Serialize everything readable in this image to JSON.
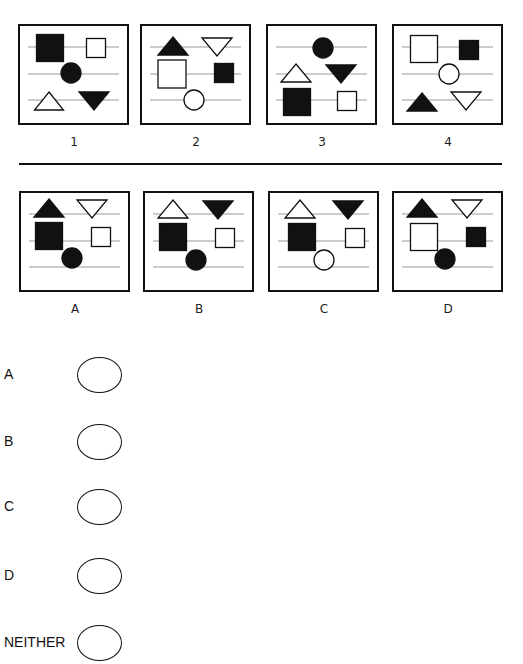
{
  "question_panels": [
    {
      "label": "1",
      "x": 18,
      "y": 24,
      "shapes": [
        {
          "type": "square",
          "fill": "black",
          "cx": 32,
          "cy": 24,
          "size": 27
        },
        {
          "type": "square",
          "fill": "white",
          "cx": 78,
          "cy": 24,
          "size": 19
        },
        {
          "type": "circle",
          "fill": "black",
          "cx": 53,
          "cy": 49,
          "r": 10
        },
        {
          "type": "triangle-up",
          "fill": "white",
          "cx": 31,
          "cy": 77,
          "w": 29,
          "h": 18
        },
        {
          "type": "triangle-down",
          "fill": "black",
          "cx": 76,
          "cy": 77,
          "w": 30,
          "h": 18
        }
      ]
    },
    {
      "label": "2",
      "x": 140,
      "y": 24,
      "shapes": [
        {
          "type": "triangle-up",
          "fill": "black",
          "cx": 33,
          "cy": 22,
          "w": 30,
          "h": 18
        },
        {
          "type": "triangle-down",
          "fill": "white",
          "cx": 77,
          "cy": 23,
          "w": 30,
          "h": 18
        },
        {
          "type": "square",
          "fill": "white",
          "cx": 32,
          "cy": 50,
          "size": 28
        },
        {
          "type": "square",
          "fill": "black",
          "cx": 84,
          "cy": 49,
          "size": 19
        },
        {
          "type": "circle",
          "fill": "white",
          "cx": 54,
          "cy": 76,
          "r": 10
        }
      ]
    },
    {
      "label": "3",
      "x": 266,
      "y": 24,
      "shapes": [
        {
          "type": "circle",
          "fill": "black",
          "cx": 57,
          "cy": 24,
          "r": 10
        },
        {
          "type": "triangle-up",
          "fill": "white",
          "cx": 30,
          "cy": 49,
          "w": 30,
          "h": 18
        },
        {
          "type": "triangle-down",
          "fill": "black",
          "cx": 75,
          "cy": 50,
          "w": 30,
          "h": 18
        },
        {
          "type": "square",
          "fill": "black",
          "cx": 31,
          "cy": 78,
          "size": 27
        },
        {
          "type": "square",
          "fill": "white",
          "cx": 81,
          "cy": 77,
          "size": 19
        }
      ]
    },
    {
      "label": "4",
      "x": 392,
      "y": 24,
      "shapes": [
        {
          "type": "square",
          "fill": "white",
          "cx": 32,
          "cy": 25,
          "size": 27
        },
        {
          "type": "square",
          "fill": "black",
          "cx": 77,
          "cy": 26,
          "size": 19
        },
        {
          "type": "circle",
          "fill": "white",
          "cx": 57,
          "cy": 50,
          "r": 10
        },
        {
          "type": "triangle-up",
          "fill": "black",
          "cx": 30,
          "cy": 78,
          "w": 30,
          "h": 18
        },
        {
          "type": "triangle-down",
          "fill": "white",
          "cx": 74,
          "cy": 77,
          "w": 30,
          "h": 18
        }
      ]
    }
  ],
  "answer_panels": [
    {
      "label": "A",
      "x": 19,
      "y": 191,
      "shapes": [
        {
          "type": "triangle-up",
          "fill": "black",
          "cx": 30,
          "cy": 17,
          "w": 30,
          "h": 18
        },
        {
          "type": "triangle-down",
          "fill": "white",
          "cx": 73,
          "cy": 18,
          "w": 30,
          "h": 18
        },
        {
          "type": "square",
          "fill": "black",
          "cx": 30,
          "cy": 45,
          "size": 27
        },
        {
          "type": "square",
          "fill": "white",
          "cx": 82,
          "cy": 46,
          "size": 19
        },
        {
          "type": "circle",
          "fill": "black",
          "cx": 53,
          "cy": 67,
          "r": 10
        }
      ]
    },
    {
      "label": "B",
      "x": 143,
      "y": 191,
      "shapes": [
        {
          "type": "triangle-up",
          "fill": "white",
          "cx": 30,
          "cy": 18,
          "w": 30,
          "h": 18
        },
        {
          "type": "triangle-down",
          "fill": "black",
          "cx": 75,
          "cy": 19,
          "w": 30,
          "h": 18
        },
        {
          "type": "square",
          "fill": "black",
          "cx": 30,
          "cy": 46,
          "size": 27
        },
        {
          "type": "square",
          "fill": "white",
          "cx": 82,
          "cy": 47,
          "size": 19
        },
        {
          "type": "circle",
          "fill": "black",
          "cx": 53,
          "cy": 69,
          "r": 10
        }
      ]
    },
    {
      "label": "C",
      "x": 268,
      "y": 191,
      "shapes": [
        {
          "type": "triangle-up",
          "fill": "white",
          "cx": 32,
          "cy": 18,
          "w": 30,
          "h": 18
        },
        {
          "type": "triangle-down",
          "fill": "black",
          "cx": 80,
          "cy": 19,
          "w": 30,
          "h": 18
        },
        {
          "type": "square",
          "fill": "black",
          "cx": 34,
          "cy": 46,
          "size": 27
        },
        {
          "type": "square",
          "fill": "white",
          "cx": 87,
          "cy": 47,
          "size": 19
        },
        {
          "type": "circle",
          "fill": "white",
          "cx": 56,
          "cy": 69,
          "r": 10
        }
      ]
    },
    {
      "label": "D",
      "x": 392,
      "y": 191,
      "shapes": [
        {
          "type": "triangle-up",
          "fill": "black",
          "cx": 30,
          "cy": 17,
          "w": 30,
          "h": 18
        },
        {
          "type": "triangle-down",
          "fill": "white",
          "cx": 75,
          "cy": 18,
          "w": 30,
          "h": 18
        },
        {
          "type": "square",
          "fill": "white",
          "cx": 32,
          "cy": 46,
          "size": 27
        },
        {
          "type": "square",
          "fill": "black",
          "cx": 84,
          "cy": 46,
          "size": 19
        },
        {
          "type": "circle",
          "fill": "black",
          "cx": 53,
          "cy": 68,
          "r": 10
        }
      ]
    }
  ],
  "choices": [
    {
      "label": "A",
      "y": 375
    },
    {
      "label": "B",
      "y": 442
    },
    {
      "label": "C",
      "y": 507
    },
    {
      "label": "D",
      "y": 576
    },
    {
      "label": "NEITHER",
      "y": 643
    }
  ],
  "colors": {
    "ink": "#111111",
    "guide_line": "#999999",
    "paper": "#ffffff"
  }
}
